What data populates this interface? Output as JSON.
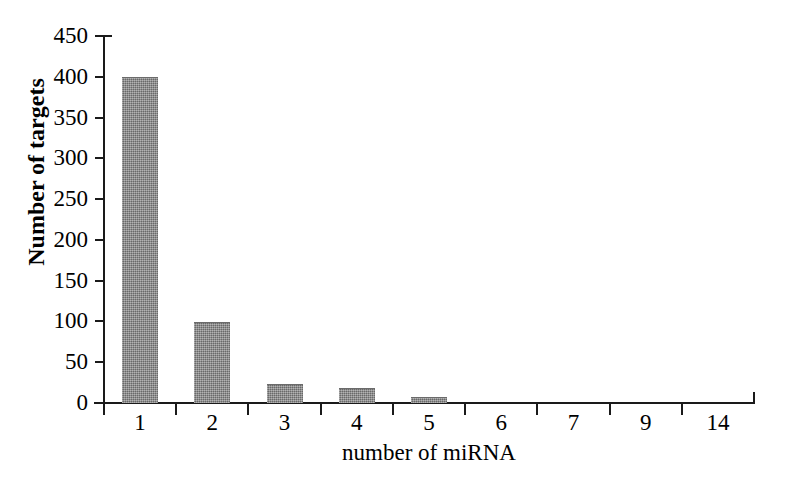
{
  "chart_data": {
    "type": "bar",
    "title": "",
    "subtitle": "",
    "xlabel": "number of miRNA",
    "ylabel": "Number of targets",
    "categories": [
      "1",
      "2",
      "3",
      "4",
      "5",
      "6",
      "7",
      "9",
      "14"
    ],
    "values": [
      398,
      98,
      22,
      17,
      6,
      0,
      0,
      0,
      0
    ],
    "series": [
      {
        "name": "Number of targets",
        "values": [
          398,
          98,
          22,
          17,
          6,
          0,
          0,
          0,
          0
        ]
      }
    ],
    "ylim": [
      0,
      450
    ],
    "ytick_labels": [
      "450",
      "400",
      "350",
      "300",
      "250",
      "200",
      "150",
      "100",
      "50",
      "0"
    ],
    "ytick_values": [
      450,
      400,
      350,
      300,
      250,
      200,
      150,
      100,
      50,
      0
    ],
    "ytick_step": 50,
    "xtick_labels": [
      "1",
      "2",
      "3",
      "4",
      "5",
      "6",
      "7",
      "9",
      "14"
    ],
    "grid": false,
    "legend": false,
    "legend_position": "none",
    "annotations": [],
    "bar_color": "#858585",
    "axis_color": "#1a1a1a",
    "background_color": "#ffffff"
  },
  "axes": {
    "y_title": "Number of targets",
    "x_title": "number of miRNA"
  }
}
